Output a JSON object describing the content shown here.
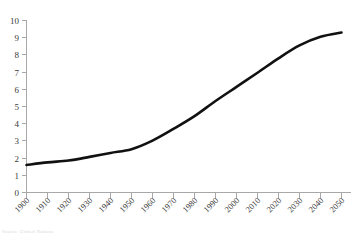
{
  "chart_data": {
    "type": "line",
    "title": "",
    "subtitle": "",
    "xlabel": "",
    "ylabel": "",
    "categories": [
      "1900",
      "1910",
      "1920",
      "1930",
      "1940",
      "1950",
      "1960",
      "1970",
      "1980",
      "1990",
      "2000",
      "2010",
      "2020",
      "2030",
      "2040",
      "2050"
    ],
    "x": [
      1900,
      1910,
      1920,
      1930,
      1940,
      1950,
      1960,
      1970,
      1980,
      1990,
      2000,
      2010,
      2020,
      2030,
      2040,
      2050
    ],
    "values": [
      1.6,
      1.75,
      1.86,
      2.07,
      2.3,
      2.52,
      3.02,
      3.7,
      4.44,
      5.32,
      6.14,
      6.96,
      7.8,
      8.55,
      9.05,
      9.3
    ],
    "series": [
      {
        "name": "",
        "values": [
          1.6,
          1.75,
          1.86,
          2.07,
          2.3,
          2.52,
          3.02,
          3.7,
          4.44,
          5.32,
          6.14,
          6.96,
          7.8,
          8.55,
          9.05,
          9.3
        ]
      }
    ],
    "ylim": [
      0,
      10
    ],
    "xlim": [
      1900,
      2050
    ],
    "yticks": [
      0,
      1,
      2,
      3,
      4,
      5,
      6,
      7,
      8,
      9,
      10
    ],
    "ytick_labels": [
      "0",
      "1",
      "2",
      "3",
      "4",
      "5",
      "6",
      "7",
      "8",
      "9",
      "10"
    ],
    "grid": false,
    "legend": false,
    "legend_position": "none",
    "line_color": "#111111",
    "axis_color": "#a8a8a8",
    "xtick_label_rotation": -45
  },
  "caption": {
    "text": "Source: United Nations"
  }
}
